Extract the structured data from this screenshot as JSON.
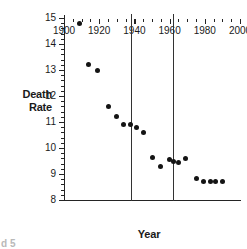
{
  "chart_data": {
    "type": "scatter",
    "title": "",
    "xlabel": "Year",
    "ylabel": "Death\nRate",
    "ylabel_lines": [
      "Death",
      "Rate"
    ],
    "xlim": [
      1900,
      2000
    ],
    "ylim": [
      8,
      15
    ],
    "grid": false,
    "legend": null,
    "x_major_ticks": [
      1900,
      1920,
      1940,
      1960,
      1980,
      2000
    ],
    "x_major_tick_labels": [
      "1900",
      "1920",
      "1940",
      "1960",
      "1980",
      "2000"
    ],
    "x_minor_tick_step": 5,
    "y_major_ticks": [
      8,
      9,
      10,
      11,
      12,
      13,
      14,
      15
    ],
    "y_major_tick_labels": [
      "8",
      "9",
      "10",
      "11",
      "12",
      "13",
      "14",
      "15"
    ],
    "y_minor_tick_step": 0.2,
    "marker": "filled-circle",
    "marker_color": "#141414",
    "x": [
      1909,
      1914,
      1919,
      1925,
      1930,
      1934,
      1938,
      1941,
      1945,
      1950,
      1955,
      1960,
      1962,
      1965,
      1969,
      1975,
      1979,
      1983,
      1986,
      1990
    ],
    "values": [
      14.8,
      13.2,
      13.0,
      11.6,
      11.2,
      10.9,
      10.9,
      10.8,
      10.6,
      9.65,
      9.3,
      9.55,
      9.5,
      9.45,
      9.6,
      8.82,
      8.7,
      8.7,
      8.72,
      8.7
    ],
    "annotations": [
      {
        "type": "vertical-line",
        "x": 1938,
        "color": "#333333"
      },
      {
        "type": "vertical-line",
        "x": 1962,
        "color": "#333333"
      }
    ]
  },
  "caption": {
    "text": "d 5"
  }
}
